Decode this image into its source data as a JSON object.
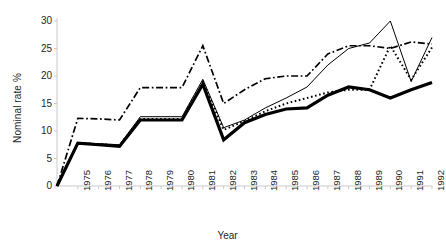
{
  "chart_data": {
    "type": "line",
    "title": "",
    "xlabel": "Year",
    "ylabel": "Nominal rate %",
    "categories": [
      "1974",
      "1975",
      "1976",
      "1977",
      "1978",
      "1979",
      "1980",
      "1981",
      "1982",
      "1983",
      "1984",
      "1985",
      "1986",
      "1987",
      "1988",
      "1989",
      "1990",
      "1991",
      "1992"
    ],
    "tick_labels": [
      "1975",
      "1976",
      "1977",
      "1978",
      "1979",
      "1980",
      "1981",
      "1982",
      "1983",
      "1984",
      "1985",
      "1986",
      "1987",
      "1988",
      "1989",
      "1990",
      "1991",
      "1992"
    ],
    "ylim": [
      0,
      30
    ],
    "yticks": [
      0,
      5,
      10,
      15,
      20,
      25,
      30
    ],
    "xlim": [
      "1974",
      "1992"
    ],
    "grid": false,
    "legend": "none",
    "series": [
      {
        "name": "series-thick-solid",
        "style": "thick-solid",
        "color": "#000000",
        "values": [
          0,
          7.8,
          7.5,
          7.2,
          12.0,
          12.0,
          12.0,
          18.5,
          8.4,
          11.5,
          13.0,
          14.0,
          14.2,
          16.5,
          18.0,
          17.5,
          16.0,
          17.5,
          18.8
        ]
      },
      {
        "name": "series-thin-solid",
        "style": "thin-solid",
        "color": "#000000",
        "values": [
          0,
          7.9,
          7.7,
          7.5,
          12.6,
          12.6,
          12.6,
          19.4,
          10.6,
          12.0,
          14.2,
          16.0,
          18.0,
          22.0,
          25.0,
          26.0,
          30.0,
          19.0,
          27.0
        ]
      },
      {
        "name": "series-dotted",
        "style": "dotted",
        "color": "#000000",
        "values": [
          0,
          7.8,
          7.6,
          7.4,
          12.2,
          12.2,
          12.2,
          18.9,
          10.2,
          11.8,
          13.6,
          15.0,
          16.0,
          17.0,
          17.5,
          17.5,
          25.5,
          19.3,
          25.2
        ]
      },
      {
        "name": "series-dash-dot",
        "style": "dash-dot",
        "color": "#000000",
        "values": [
          0,
          12.3,
          12.2,
          12.0,
          17.9,
          17.9,
          17.9,
          25.5,
          15.0,
          17.5,
          19.5,
          20.0,
          20.0,
          24.0,
          25.5,
          25.5,
          25.0,
          26.2,
          25.8
        ]
      }
    ]
  },
  "axis": {
    "ytick_texts": [
      "30",
      "25",
      "20",
      "15",
      "10",
      "5",
      "0"
    ]
  }
}
